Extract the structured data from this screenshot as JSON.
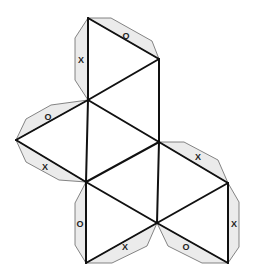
{
  "diagram": {
    "colors": {
      "line": "#111111",
      "tab_fill": "#ebebeb",
      "tab_stroke": "#666666",
      "background": "#ffffff"
    },
    "vertices": {
      "A": [
        88,
        18
      ],
      "B": [
        159,
        59
      ],
      "C": [
        88,
        100
      ],
      "D": [
        159,
        142
      ],
      "L": [
        16,
        140
      ],
      "E": [
        86,
        182
      ],
      "F": [
        228,
        183
      ],
      "G": [
        157,
        223
      ],
      "H": [
        86,
        263
      ],
      "I": [
        228,
        263
      ]
    },
    "edges": [
      [
        "A",
        "B"
      ],
      [
        "A",
        "C"
      ],
      [
        "B",
        "C"
      ],
      [
        "B",
        "D"
      ],
      [
        "C",
        "D"
      ],
      [
        "C",
        "L"
      ],
      [
        "C",
        "E"
      ],
      [
        "L",
        "E"
      ],
      [
        "E",
        "D"
      ],
      [
        "D",
        "F"
      ],
      [
        "D",
        "G"
      ],
      [
        "E",
        "G"
      ],
      [
        "F",
        "G"
      ],
      [
        "F",
        "I"
      ],
      [
        "G",
        "I"
      ],
      [
        "E",
        "H"
      ],
      [
        "G",
        "H"
      ]
    ],
    "tabs": [
      {
        "edge": [
          "A",
          "C"
        ],
        "label": "X",
        "points": [
          [
            88,
            18
          ],
          [
            75,
            38
          ],
          [
            75,
            80
          ],
          [
            88,
            100
          ]
        ],
        "label_pos": [
          81,
          61
        ]
      },
      {
        "edge": [
          "A",
          "B"
        ],
        "label": "O",
        "points": [
          [
            88,
            18
          ],
          [
            111,
            18
          ],
          [
            152,
            41
          ],
          [
            159,
            59
          ]
        ],
        "label_pos": [
          126,
          37
        ]
      },
      {
        "edge": [
          "L",
          "C"
        ],
        "label": "O",
        "points": [
          [
            16,
            140
          ],
          [
            26,
            119
          ],
          [
            51,
            105
          ],
          [
            88,
            100
          ]
        ],
        "label_pos": [
          48,
          118
        ]
      },
      {
        "edge": [
          "L",
          "E"
        ],
        "label": "X",
        "points": [
          [
            16,
            140
          ],
          [
            26,
            162
          ],
          [
            59,
            180
          ],
          [
            86,
            182
          ]
        ],
        "label_pos": [
          45,
          168
        ]
      },
      {
        "edge": [
          "D",
          "F"
        ],
        "label": "X",
        "points": [
          [
            159,
            142
          ],
          [
            184,
            142
          ],
          [
            218,
            160
          ],
          [
            228,
            183
          ]
        ],
        "label_pos": [
          198,
          158
        ]
      },
      {
        "edge": [
          "F",
          "I"
        ],
        "label": "X",
        "points": [
          [
            228,
            183
          ],
          [
            239,
            202
          ],
          [
            239,
            247
          ],
          [
            228,
            263
          ]
        ],
        "label_pos": [
          234,
          225
        ]
      },
      {
        "edge": [
          "E",
          "H"
        ],
        "label": "O",
        "points": [
          [
            86,
            182
          ],
          [
            75,
            203
          ],
          [
            75,
            245
          ],
          [
            86,
            263
          ]
        ],
        "label_pos": [
          80,
          225
        ]
      },
      {
        "edge": [
          "H",
          "G"
        ],
        "label": "X",
        "points": [
          [
            86,
            263
          ],
          [
            112,
            263
          ],
          [
            147,
            246
          ],
          [
            157,
            223
          ]
        ],
        "label_pos": [
          125,
          248
        ]
      },
      {
        "edge": [
          "G",
          "I"
        ],
        "label": "O",
        "points": [
          [
            157,
            223
          ],
          [
            168,
            246
          ],
          [
            202,
            263
          ],
          [
            228,
            263
          ]
        ],
        "label_pos": [
          186,
          248
        ]
      }
    ]
  }
}
